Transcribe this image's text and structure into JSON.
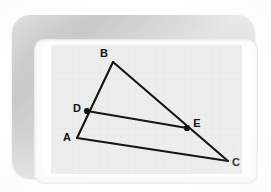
{
  "scene": {
    "title": "Geometry diagram on a framed whiteboard",
    "frame_color": "#d2d2d2",
    "mat_color": "#fbfbfb",
    "canvas_color": "#ededed",
    "ink_color": "#141414"
  },
  "figure": {
    "type": "triangle-with-midsegment",
    "labels": {
      "A": "A",
      "B": "B",
      "C": "C",
      "D": "D",
      "E": "E"
    },
    "points": {
      "A": {
        "x": 26,
        "y": 93,
        "label_x": 16,
        "label_y": 96
      },
      "B": {
        "x": 62,
        "y": 17,
        "label_x": 53,
        "label_y": 12
      },
      "C": {
        "x": 177,
        "y": 116,
        "label_x": 185,
        "label_y": 120
      },
      "D": {
        "x": 36,
        "y": 66,
        "label_x": 26,
        "label_y": 66
      },
      "E": {
        "x": 136,
        "y": 83,
        "label_x": 145,
        "label_y": 83
      }
    },
    "edges": [
      {
        "name": "segment-AB",
        "from": "A",
        "to": "B"
      },
      {
        "name": "segment-BC",
        "from": "B",
        "to": "C"
      },
      {
        "name": "segment-AC",
        "from": "A",
        "to": "C"
      },
      {
        "name": "segment-DE",
        "from": "D",
        "to": "E"
      }
    ],
    "marked_points": [
      "D",
      "E"
    ]
  }
}
